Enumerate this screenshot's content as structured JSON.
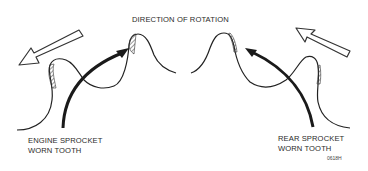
{
  "diagram": {
    "title": "DIRECTION OF ROTATION",
    "left": {
      "line1": "ENGINE SPROCKET",
      "line2": "WORN TOOTH"
    },
    "right": {
      "line1": "REAR SPROCKET",
      "line2": "WORN TOOTH"
    },
    "figure_code": "0618H"
  }
}
